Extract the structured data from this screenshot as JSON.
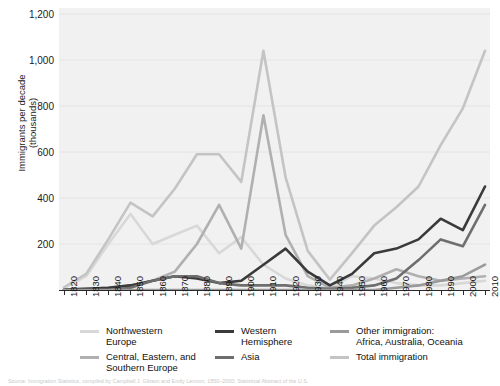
{
  "axis": {
    "ylabel": "Immigrants per decade\n(thousands)",
    "yticks": [
      "1,200",
      "1,000",
      "800",
      "600",
      "400",
      "200"
    ],
    "xticks": [
      "1820",
      "1830",
      "1840",
      "1850",
      "1860",
      "1870",
      "1880",
      "1890",
      "1900",
      "1910",
      "1920",
      "1930",
      "1940",
      "1950",
      "1960",
      "1970",
      "1980",
      "1990",
      "2000",
      "2010"
    ]
  },
  "legend": {
    "items": [
      {
        "label": "Northwestern\nEurope",
        "color": "#d8d8d8"
      },
      {
        "label": "Central, Eastern, and\nSouthern Europe",
        "color": "#b0b0b0"
      },
      {
        "label": "Western\nHemisphere",
        "color": "#3a3a3a"
      },
      {
        "label": "Asia",
        "color": "#6e6e6e"
      },
      {
        "label": "Other immigration:\nAfrica, Australia, Oceania",
        "color": "#9a9a9a"
      },
      {
        "label": "Total immigration",
        "color": "#c4c4c4"
      }
    ]
  },
  "source_note": "Source: Immigration Statistics, compiled by Campbell J. Gibson and Emily Lennon, 1850–2000; Statistical Abstract of the U.S.",
  "chart_data": {
    "type": "line",
    "title": "",
    "xlabel": "",
    "ylabel": "Immigrants per decade (thousands)",
    "xlim": [
      1820,
      2010
    ],
    "ylim": [
      0,
      1200
    ],
    "grid": true,
    "legend_position": "below",
    "x": [
      1820,
      1830,
      1840,
      1850,
      1860,
      1870,
      1880,
      1890,
      1900,
      1910,
      1920,
      1930,
      1940,
      1950,
      1960,
      1970,
      1980,
      1990,
      2000,
      2010
    ],
    "series": [
      {
        "name": "Northwestern Europe",
        "color": "#d8d8d8",
        "values": [
          8,
          60,
          200,
          330,
          200,
          240,
          280,
          160,
          230,
          110,
          50,
          20,
          10,
          60,
          50,
          30,
          20,
          20,
          30,
          40
        ]
      },
      {
        "name": "Central, Eastern, and Southern Europe",
        "color": "#b0b0b0",
        "values": [
          2,
          5,
          10,
          20,
          40,
          80,
          200,
          370,
          180,
          760,
          240,
          60,
          10,
          20,
          50,
          90,
          60,
          40,
          50,
          60
        ]
      },
      {
        "name": "Western Hemisphere",
        "color": "#3a3a3a",
        "values": [
          2,
          5,
          10,
          20,
          40,
          60,
          50,
          30,
          40,
          110,
          180,
          80,
          20,
          70,
          160,
          180,
          220,
          310,
          260,
          450
        ]
      },
      {
        "name": "Asia",
        "color": "#6e6e6e",
        "values": [
          0,
          0,
          0,
          10,
          40,
          60,
          60,
          30,
          20,
          20,
          20,
          10,
          5,
          10,
          20,
          50,
          130,
          220,
          190,
          370
        ]
      },
      {
        "name": "Other immigration: Africa, Australia, Oceania",
        "color": "#9a9a9a",
        "values": [
          0,
          0,
          0,
          0,
          0,
          0,
          0,
          0,
          0,
          0,
          0,
          0,
          0,
          0,
          0,
          10,
          20,
          40,
          60,
          110
        ]
      },
      {
        "name": "Total immigration",
        "color": "#c4c4c4",
        "values": [
          12,
          70,
          220,
          380,
          320,
          440,
          590,
          590,
          470,
          1040,
          490,
          170,
          45,
          160,
          280,
          360,
          450,
          630,
          790,
          1040
        ]
      }
    ]
  }
}
